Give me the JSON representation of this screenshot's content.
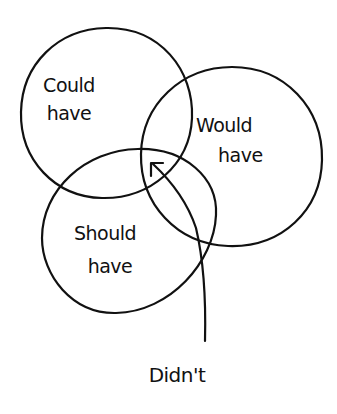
{
  "diagram": {
    "type": "venn",
    "sets": [
      {
        "id": "could",
        "line1": "Could",
        "line2": "have"
      },
      {
        "id": "would",
        "line1": "Would",
        "line2": "have"
      },
      {
        "id": "should",
        "line1": "Should",
        "line2": "have"
      }
    ],
    "annotation": {
      "label": "Didn't",
      "points_to": "outside all three sets (arrow from below)"
    },
    "colors": {
      "ink": "#111111",
      "background": "#ffffff"
    }
  }
}
